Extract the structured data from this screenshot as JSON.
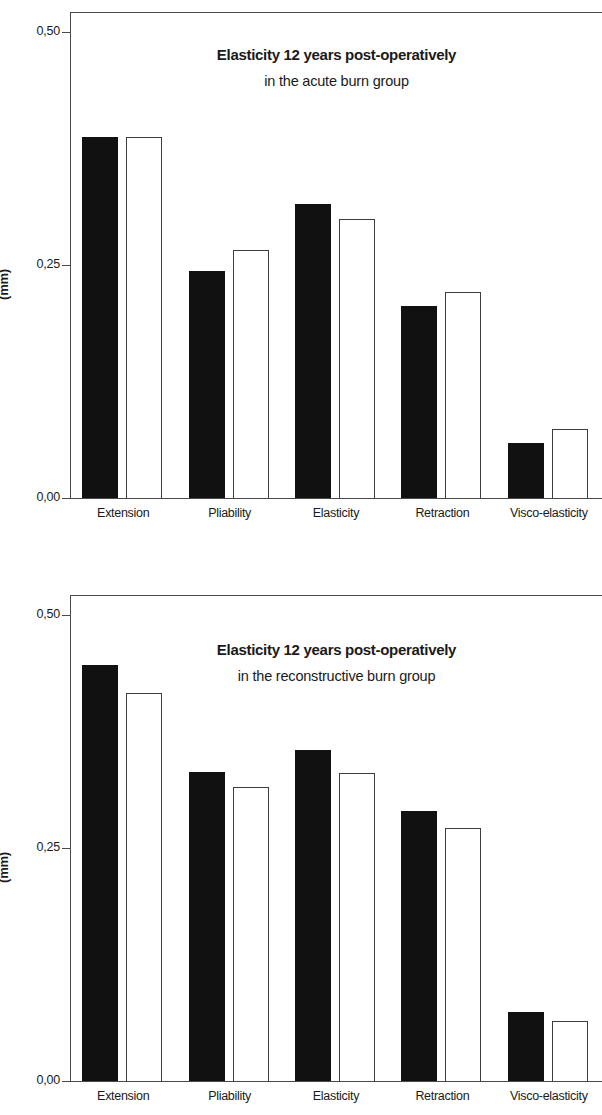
{
  "figure": {
    "panels": [
      {
        "id": "acute",
        "title": "Elasticity 12 years post-operatively",
        "subtitle": "in the acute burn group",
        "y_axis_title": "(mm)",
        "y_ticks": [
          "0,50",
          "0,25",
          "0,00"
        ],
        "categories": [
          "Extension",
          "Pliability",
          "Elasticity",
          "Retraction",
          "Visco-elasticity"
        ]
      },
      {
        "id": "reconstructive",
        "title": "Elasticity 12 years post-operatively",
        "subtitle": "in the reconstructive burn group",
        "y_axis_title": "(mm)",
        "y_ticks": [
          "0,50",
          "0,25",
          "0,00"
        ],
        "categories": [
          "Extension",
          "Pliability",
          "Elasticity",
          "Retraction",
          "Visco-elasticity"
        ]
      }
    ]
  },
  "chart_data": [
    {
      "type": "bar",
      "title": "Elasticity 12 years post-operatively",
      "subtitle": "in the acute burn group",
      "xlabel": "",
      "ylabel": "(mm)",
      "ylim": [
        0,
        0.54
      ],
      "yticks": [
        0.0,
        0.25,
        0.5
      ],
      "ytick_labels": [
        "0,00",
        "0,25",
        "0,50"
      ],
      "grid": false,
      "legend": "none",
      "categories": [
        "Extension",
        "Pliability",
        "Elasticity",
        "Retraction",
        "Visco-elasticity"
      ],
      "series": [
        {
          "name": "black-bar",
          "fill": "#111111",
          "values": [
            0.401,
            0.253,
            0.327,
            0.214,
            0.062
          ]
        },
        {
          "name": "white-bar",
          "fill": "#ffffff",
          "values": [
            0.401,
            0.276,
            0.311,
            0.229,
            0.078
          ]
        }
      ]
    },
    {
      "type": "bar",
      "title": "Elasticity 12 years post-operatively",
      "subtitle": "in the reconstructive burn group",
      "xlabel": "",
      "ylabel": "(mm)",
      "ylim": [
        0,
        0.54
      ],
      "yticks": [
        0.0,
        0.25,
        0.5
      ],
      "ytick_labels": [
        "0,00",
        "0,25",
        "0,50"
      ],
      "grid": false,
      "legend": "none",
      "categories": [
        "Extension",
        "Pliability",
        "Elasticity",
        "Retraction",
        "Visco-elasticity"
      ],
      "series": [
        {
          "name": "black-bar",
          "fill": "#111111",
          "values": [
            0.463,
            0.344,
            0.369,
            0.301,
            0.078
          ]
        },
        {
          "name": "white-bar",
          "fill": "#ffffff",
          "values": [
            0.432,
            0.328,
            0.343,
            0.282,
            0.068
          ]
        }
      ]
    }
  ],
  "colors": {
    "bar_filled": "#111111",
    "bar_hollow_border": "#3d3d3d",
    "axis": "#4a4a4a",
    "text": "#1a1a1a",
    "background": "#ffffff"
  }
}
